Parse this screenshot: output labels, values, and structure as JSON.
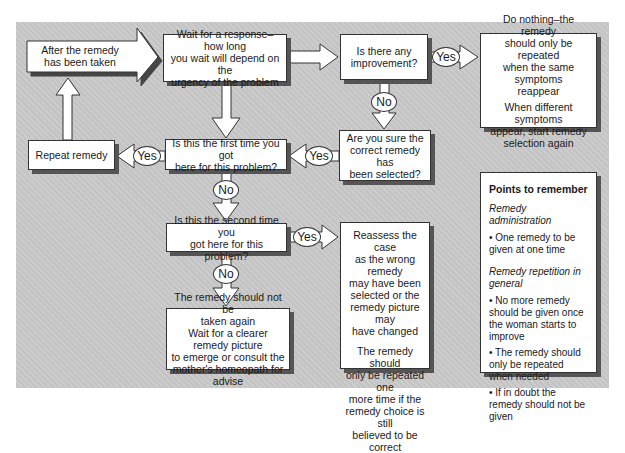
{
  "diagram": {
    "type": "flowchart",
    "start": {
      "text": "After the remedy has been taken",
      "lines": [
        "After the remedy",
        "has been taken"
      ]
    },
    "nodes": {
      "wait": {
        "lines": [
          "Wait for a response–how long",
          "you wait will depend on the",
          "urgency of the problem"
        ]
      },
      "improvement": {
        "lines": [
          "Is there any",
          "improvement?"
        ]
      },
      "do_nothing": {
        "para1": [
          "Do nothing–the remedy",
          "should only be repeated",
          "when the same symptoms",
          "reappear"
        ],
        "para2": [
          "When different symptoms",
          "appear, start remedy",
          "selection again"
        ]
      },
      "sure": {
        "lines": [
          "Are you sure the",
          "correct remedy has",
          "been selected?"
        ]
      },
      "first_time": {
        "lines": [
          "Is this the first time you got",
          "here for this problem?"
        ]
      },
      "repeat": {
        "lines": [
          "Repeat remedy"
        ]
      },
      "second_time": {
        "lines": [
          "Is this the second time you",
          "got here for this problem?"
        ]
      },
      "reassess": {
        "para1": [
          "Reassess the case",
          "as the wrong remedy",
          "may have been",
          "selected or the",
          "remedy picture may",
          "have changed"
        ],
        "para2": [
          "The remedy should",
          "only be repeated one",
          "more time if the",
          "remedy choice is still",
          "believed to be correct"
        ]
      },
      "not_again": {
        "para1": [
          "The remedy should not be",
          "taken again"
        ],
        "para2": [
          "Wait for a clearer remedy picture",
          "to emerge or consult the",
          "mother's homeopath for advise"
        ]
      }
    },
    "edge_labels": {
      "improvement_yes": "Yes",
      "improvement_no": "No",
      "sure_yes": "Yes",
      "first_yes": "Yes",
      "first_no": "No",
      "second_yes": "Yes",
      "second_no": "No"
    },
    "points_to_remember": {
      "title": "Points to remember",
      "section1": {
        "heading": "Remedy administration",
        "bullets": [
          "One remedy to be given at one time"
        ]
      },
      "section2": {
        "heading": "Remedy repetition in general",
        "bullets": [
          "No more remedy should be given once the woman starts to improve",
          "The remedy should only be repeated when needed",
          "If in doubt the remedy should not be given"
        ]
      }
    }
  }
}
